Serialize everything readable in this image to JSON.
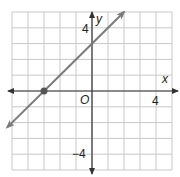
{
  "chart_data": {
    "type": "line",
    "title": "",
    "xlabel": "x",
    "ylabel": "y",
    "xlim": [
      -5,
      5
    ],
    "ylim": [
      -5,
      5
    ],
    "grid": true,
    "grid_step": 1,
    "origin_label": "O",
    "tick_labels": {
      "x": [
        {
          "value": 4,
          "label": "4"
        }
      ],
      "y": [
        {
          "value": 4,
          "label": "4"
        },
        {
          "value": -4,
          "label": "−4"
        }
      ]
    },
    "series": [
      {
        "name": "line",
        "equation": "y = x + 3",
        "slope": 1,
        "intercept": 3,
        "x": [
          -5.3,
          2
        ],
        "y": [
          -2.3,
          5
        ],
        "arrows": "both"
      }
    ],
    "points": [
      {
        "x": -3,
        "y": 0,
        "label": ""
      }
    ],
    "colors": {
      "grid": "#c8c8c8",
      "axes": "#333333",
      "line": "#7a7a7a",
      "point": "#555555"
    },
    "legend": null
  },
  "labels": {
    "x_axis": "x",
    "y_axis": "y",
    "origin": "O",
    "x_tick_4": "4",
    "y_tick_4": "4",
    "y_tick_neg4": "−4"
  }
}
